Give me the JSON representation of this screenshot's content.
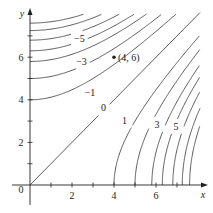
{
  "chart_data": {
    "type": "line",
    "subtype": "contour",
    "title": "",
    "xlabel": "x",
    "ylabel": "y",
    "xlim": [
      0,
      8
    ],
    "ylim": [
      0,
      8
    ],
    "x_ticks": [
      1,
      2,
      3,
      4,
      5,
      6,
      7
    ],
    "x_tick_labels": {
      "2": "2",
      "4": "4",
      "6": "6"
    },
    "y_ticks": [
      1,
      2,
      3,
      4,
      5,
      6,
      7
    ],
    "y_tick_labels": {
      "2": "2",
      "4": "4",
      "6": "6"
    },
    "origin_label": "0",
    "grid": false,
    "zero_level": {
      "label": "0",
      "curve": "y = x",
      "label_at": [
        3.5,
        3.65
      ]
    },
    "positive_levels": {
      "description": "curves opening toward +x, x-intercepts",
      "intercepts": [
        4.0,
        5.0,
        5.8,
        6.3,
        6.8,
        7.25,
        7.6
      ],
      "labels": [
        {
          "text": "1",
          "index": 0,
          "at": [
            4.5,
            3.05
          ]
        },
        {
          "text": "3",
          "index": 2,
          "at": [
            6.05,
            2.85
          ]
        },
        {
          "text": "5",
          "index": 4,
          "at": [
            6.95,
            2.75
          ]
        }
      ]
    },
    "negative_levels": {
      "description": "curves opening toward +y, y-intercepts",
      "intercepts": [
        4.0,
        5.0,
        5.8,
        6.3,
        6.8,
        7.25,
        7.6
      ],
      "labels": [
        {
          "text": "−1",
          "index": 0,
          "at": [
            2.85,
            4.35
          ]
        },
        {
          "text": "−3",
          "index": 2,
          "at": [
            2.45,
            5.8
          ]
        },
        {
          "text": "−5",
          "index": 4,
          "at": [
            2.35,
            6.9
          ]
        }
      ]
    },
    "points": [
      {
        "x": 4,
        "y": 6,
        "label": "(4, 6)"
      }
    ]
  },
  "colors": {
    "curve": "#333333",
    "axis": "#222222",
    "background": "#ffffff"
  }
}
